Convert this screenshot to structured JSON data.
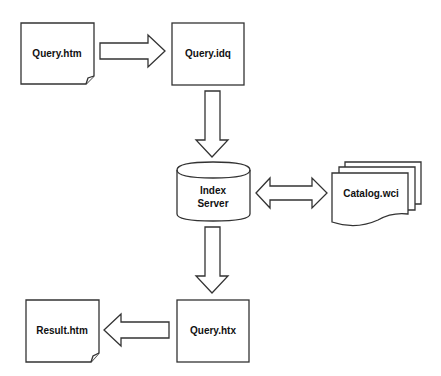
{
  "diagram": {
    "colors": {
      "stroke": "#333333",
      "fill": "#ffffff",
      "text": "#111111"
    },
    "nodes": [
      {
        "id": "query_htm",
        "label": "Query.htm",
        "shape": "document-folded-corner"
      },
      {
        "id": "query_idq",
        "label": "Query.idq",
        "shape": "rectangle"
      },
      {
        "id": "index_server",
        "label_line1": "Index",
        "label_line2": "Server",
        "shape": "cylinder"
      },
      {
        "id": "catalog_wci",
        "label": "Catalog.wci",
        "shape": "multi-document"
      },
      {
        "id": "query_htx",
        "label": "Query.htx",
        "shape": "rectangle"
      },
      {
        "id": "result_htm",
        "label": "Result.htm",
        "shape": "document-folded-corner"
      }
    ],
    "edges": [
      {
        "from": "query_htm",
        "to": "query_idq",
        "direction": "right"
      },
      {
        "from": "query_idq",
        "to": "index_server",
        "direction": "down"
      },
      {
        "from": "index_server",
        "to": "catalog_wci",
        "direction": "bidirectional"
      },
      {
        "from": "index_server",
        "to": "query_htx",
        "direction": "down"
      },
      {
        "from": "query_htx",
        "to": "result_htm",
        "direction": "left"
      }
    ]
  }
}
